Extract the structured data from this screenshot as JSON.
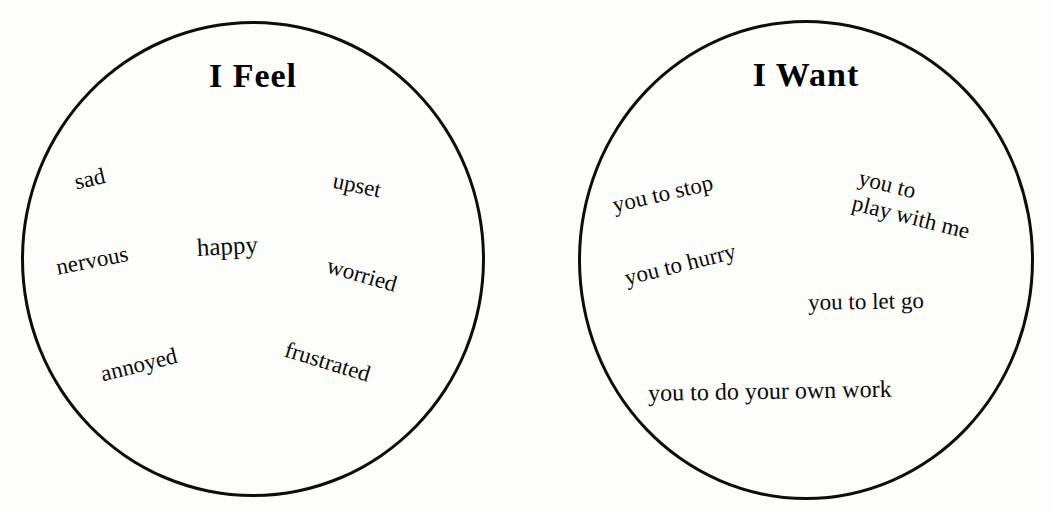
{
  "page": {
    "background_color": "#fdfdfb",
    "ink_color": "#0d0d0d"
  },
  "circles": [
    {
      "id": "feel",
      "title": "I Feel",
      "words": [
        {
          "text": "sad",
          "x": 72,
          "y": 170,
          "rotate": -13,
          "size": 23
        },
        {
          "text": "upset",
          "x": 336,
          "y": 168,
          "rotate": 12,
          "size": 23
        },
        {
          "text": "happy",
          "x": 196,
          "y": 234,
          "rotate": -3,
          "size": 25
        },
        {
          "text": "nervous",
          "x": 54,
          "y": 255,
          "rotate": -11,
          "size": 23
        },
        {
          "text": "worried",
          "x": 331,
          "y": 253,
          "rotate": 16,
          "size": 23
        },
        {
          "text": "annoyed",
          "x": 98,
          "y": 362,
          "rotate": -14,
          "size": 23
        },
        {
          "text": "frustrated",
          "x": 289,
          "y": 337,
          "rotate": 17,
          "size": 23
        }
      ]
    },
    {
      "id": "want",
      "title": "I Want",
      "words": [
        {
          "text": "you to stop",
          "x": 610,
          "y": 193,
          "rotate": -13,
          "size": 23
        },
        {
          "text": "you to hurry",
          "x": 622,
          "y": 266,
          "rotate": -14,
          "size": 23
        },
        {
          "text": "you to let go",
          "x": 808,
          "y": 290,
          "rotate": -1,
          "size": 23
        },
        {
          "text": "you to do your own work",
          "x": 648,
          "y": 380,
          "rotate": -1,
          "size": 24
        }
      ],
      "multiline_words": [
        {
          "lines": [
            "you to",
            "play with me"
          ],
          "x": 862,
          "y": 165,
          "rotate": 14,
          "size": 23
        }
      ]
    }
  ]
}
